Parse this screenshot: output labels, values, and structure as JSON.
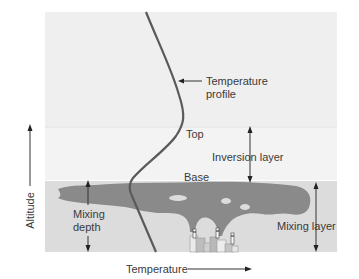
{
  "diagram": {
    "labels": {
      "temperature_profile": [
        "Temperature",
        "profile"
      ],
      "top": "Top",
      "base": "Base",
      "inversion_layer": "Inversion layer",
      "mixing_depth": [
        "Mixing",
        "depth"
      ],
      "mixing_layer": "Mixing layer",
      "x_axis": "Temperature",
      "y_axis": "Altitude"
    },
    "colors": {
      "upper_air": "#efefef",
      "inversion_band": "#f2f2f2",
      "mixing_layer": "#dcdcdc",
      "smoke": "#8a8a8a",
      "profile_line": "#5a5a5a",
      "text": "#3a3a3a"
    }
  }
}
